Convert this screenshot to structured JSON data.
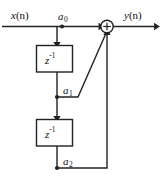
{
  "diagram": {
    "background_color": "#ffffff",
    "line_color": "#222222",
    "text_color": "#111111",
    "input": {
      "label_var": "x",
      "label_arg": "(n)",
      "name": "input-signal-label"
    },
    "output": {
      "label_var": "y",
      "label_arg": "(n)",
      "name": "output-signal-label"
    },
    "adder": {
      "symbol": "+",
      "name": "summing-junction"
    },
    "delays": [
      {
        "base": "z",
        "exponent": "-1"
      },
      {
        "base": "z",
        "exponent": "-1"
      }
    ],
    "coefficients": [
      {
        "base": "a",
        "sub": "0"
      },
      {
        "base": "a",
        "sub": "1"
      },
      {
        "base": "a",
        "sub": "2"
      }
    ]
  }
}
